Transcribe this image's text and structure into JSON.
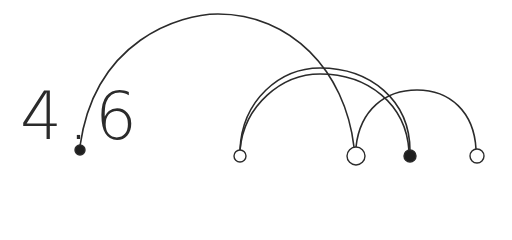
{
  "title": "4.6",
  "colors": {
    "stroke": "#2b2b2b",
    "background": "#ffffff",
    "fill_dot": "#1f1f1f"
  },
  "nodes": [
    {
      "id": "n0",
      "x": 80,
      "y": 150,
      "r": 5,
      "filled": true
    },
    {
      "id": "n1",
      "x": 240,
      "y": 156,
      "r": 6,
      "filled": false
    },
    {
      "id": "n2",
      "x": 356,
      "y": 156,
      "r": 9,
      "filled": false
    },
    {
      "id": "n3",
      "x": 410,
      "y": 156,
      "r": 6,
      "filled": true
    },
    {
      "id": "n4",
      "x": 477,
      "y": 156,
      "r": 7,
      "filled": false
    }
  ],
  "arcs": [
    {
      "from": "n0",
      "to": "n2",
      "d": "M80,146 C95,40 180,14 218,14 C290,14 345,70 354,147"
    },
    {
      "from": "n1",
      "to": "n3",
      "d": "M240,150 C242,100 280,68 320,68 C370,68 410,100 410,151",
      "outer": true
    },
    {
      "from": "n1",
      "to": "n3",
      "d": "M240,150 C244,105 282,74 320,74 C368,74 406,104 409,151"
    },
    {
      "from": "n2",
      "to": "n4",
      "d": "M356,147 C360,110 385,90 417,90 C450,90 474,112 476,149"
    }
  ]
}
